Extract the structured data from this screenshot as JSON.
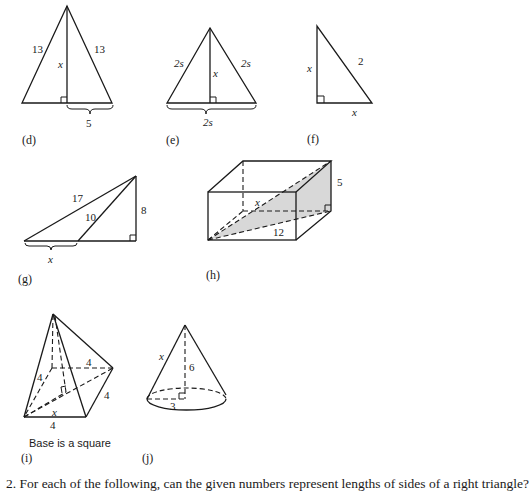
{
  "figures": {
    "d": {
      "caption": "(d)",
      "left_side": "13",
      "right_side": "13",
      "height": "x",
      "half_base": "5"
    },
    "e": {
      "caption": "(e)",
      "left_side": "2s",
      "right_side": "2s",
      "height": "x",
      "base": "2s"
    },
    "f": {
      "caption": "(f)",
      "leg_vertical": "x",
      "leg_horizontal": "x",
      "hypotenuse": "2"
    },
    "g": {
      "caption": "(g)",
      "long_side": "17",
      "inner_side": "10",
      "height": "8",
      "base_segment": "x"
    },
    "h": {
      "caption": "(h)",
      "height": "5",
      "diagonal_base": "12",
      "space_diagonal": "x"
    },
    "i": {
      "caption": "(i)",
      "slant_edge": "4",
      "base_back": "4",
      "base_right": "4",
      "base_front": "4",
      "half_diagonal": "x",
      "note": "Base is a square"
    },
    "j": {
      "caption": "(j)",
      "slant": "x",
      "height": "6",
      "radius": "3"
    }
  },
  "question": {
    "text": "2.  For each of the following, can the given numbers represent lengths of sides of a right triangle?"
  }
}
